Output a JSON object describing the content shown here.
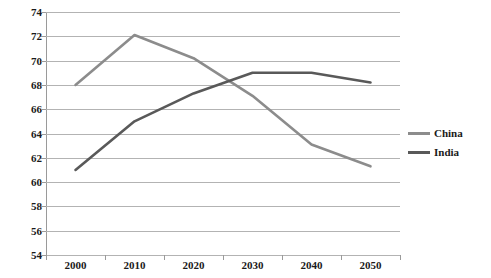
{
  "chart_data": {
    "type": "line",
    "title": "",
    "subtitle": "",
    "xlabel": "",
    "ylabel": "",
    "categories": [
      "2000",
      "2010",
      "2020",
      "2030",
      "2040",
      "2050"
    ],
    "x": [
      2000,
      2010,
      2020,
      2030,
      2040,
      2050
    ],
    "series": [
      {
        "name": "China",
        "color": "#8c8c8c",
        "values": [
          68.0,
          72.1,
          70.2,
          67.1,
          63.1,
          61.3
        ]
      },
      {
        "name": "India",
        "color": "#595959",
        "values": [
          61.0,
          65.0,
          67.3,
          69.0,
          69.0,
          68.2
        ]
      }
    ],
    "ylim": [
      54,
      74
    ],
    "yticks": [
      54,
      56,
      58,
      60,
      62,
      64,
      66,
      68,
      70,
      72,
      74
    ],
    "ytick_labels": [
      "54",
      "56",
      "58",
      "60",
      "62",
      "64",
      "66",
      "68",
      "70",
      "72",
      "74"
    ],
    "xtick_labels": [
      "2000",
      "2010",
      "2020",
      "2030",
      "2040",
      "2050"
    ],
    "grid": true,
    "grid_axis": "y",
    "grid_color": "#b3b3b3",
    "legend": true,
    "legend_position": "right",
    "legend_entries": [
      "China",
      "India"
    ],
    "background_color": "#ffffff",
    "axis_color": "#9a9a9a",
    "text_color": "#1a1a1a"
  }
}
